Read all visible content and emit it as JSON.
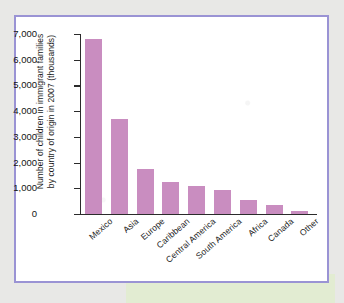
{
  "figure": {
    "frame_color": "#9a93d4",
    "band_color": "#e2ecd2",
    "page_color": "#e8e8e6"
  },
  "chart_data": {
    "type": "bar",
    "title": "",
    "xlabel": "",
    "ylabel_line1": "Number of children in immigrant families",
    "ylabel_line2": "by country of origin in 2007 (thousands)",
    "categories": [
      "Mexico",
      "Asia",
      "Europe",
      "Caribbean",
      "Central America",
      "South America",
      "Africa",
      "Canada",
      "Other"
    ],
    "values": [
      6800,
      3700,
      1750,
      1250,
      1080,
      920,
      550,
      350,
      130
    ],
    "ylim": [
      0,
      7000
    ],
    "yticks": [
      0,
      1000,
      2000,
      3000,
      4000,
      5000,
      6000,
      7000
    ],
    "ytick_labels": [
      "0",
      "1,000",
      "2,000",
      "3,000",
      "4,000",
      "5,000",
      "6,000",
      "7,000"
    ],
    "grid": false,
    "legend": false,
    "bar_color": "#c98dc0"
  }
}
